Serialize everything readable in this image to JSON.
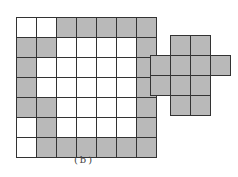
{
  "figure": {
    "caption": "(b)",
    "colors": {
      "shaded": "#b9b9b9",
      "empty": "#ffffff",
      "line": "#333333"
    },
    "left_grid": {
      "rows": [
        "wwggggg",
        "ggwwwwg",
        "gwwwwwg",
        "gwwwwwg",
        "ggwwwwg",
        "wgwwwwg",
        "wgggggg"
      ]
    },
    "right_shape": {
      "rows": [
        "eggE",
        "gggg",
        "ggge",
        "egge"
      ]
    }
  }
}
